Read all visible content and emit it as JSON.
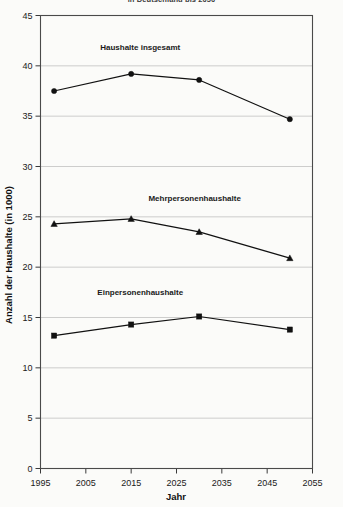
{
  "chart_data": {
    "type": "line",
    "title": "in Deutschland bis 2050",
    "xlabel": "Jahr",
    "ylabel": "Anzahl der Haushalte (in 1000)",
    "x": [
      1998,
      2015,
      2030,
      2050
    ],
    "xlim": [
      1995,
      2055
    ],
    "ylim": [
      0,
      45
    ],
    "xticks": [
      1995,
      2005,
      2015,
      2025,
      2035,
      2045,
      2055
    ],
    "yticks": [
      0,
      5,
      10,
      15,
      20,
      25,
      30,
      35,
      40,
      45
    ],
    "grid": true,
    "legend_position": "inline-above-series",
    "series": [
      {
        "name": "Haushalte insgesamt",
        "marker": "circle",
        "color": "#111111",
        "values": [
          37.5,
          39.2,
          38.6,
          34.7
        ],
        "label_x": 2017,
        "label_y": 41.6
      },
      {
        "name": "Mehrpersonenhaushalte",
        "marker": "triangle",
        "color": "#111111",
        "values": [
          24.3,
          24.8,
          23.5,
          20.9
        ],
        "label_x": 2029,
        "label_y": 26.6
      },
      {
        "name": "Einpersonenhaushalte",
        "marker": "square",
        "color": "#111111",
        "values": [
          13.2,
          14.3,
          15.1,
          13.8
        ],
        "label_x": 2017,
        "label_y": 17.2
      }
    ]
  }
}
